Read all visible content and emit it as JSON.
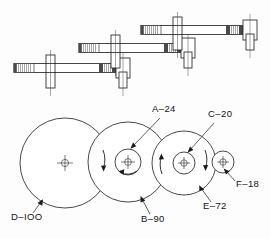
{
  "drawing": {
    "title": "Gear train assembly drawing",
    "background_color": "#fdfdfd",
    "line_color": "#1b1b1b"
  },
  "labels": {
    "a24": "A–24",
    "c20": "C–20",
    "f18": "F–18",
    "d100": "D–IOO",
    "b90": "B–90",
    "e72": "E–72"
  },
  "gears": [
    {
      "id": "D-100",
      "label": "D–IOO",
      "teeth": 100,
      "cx": 65,
      "cy": 163,
      "r": 45,
      "label_x": 14,
      "label_y": 217
    },
    {
      "id": "B-90",
      "label": "B–90",
      "teeth": 90,
      "cx": 128,
      "cy": 162,
      "r": 40,
      "label_x": 140,
      "label_y": 222
    },
    {
      "id": "A-24",
      "label": "A–24",
      "teeth": 24,
      "cx": 128,
      "cy": 162,
      "r": 13,
      "label_x": 154,
      "label_y": 112
    },
    {
      "id": "E-72",
      "label": "E–72",
      "teeth": 72,
      "cx": 184,
      "cy": 163,
      "r": 32,
      "label_x": 203,
      "label_y": 210
    },
    {
      "id": "C-20",
      "label": "C–20",
      "teeth": 20,
      "cx": 184,
      "cy": 163,
      "r": 11,
      "label_x": 208,
      "label_y": 117
    },
    {
      "id": "F-18",
      "label": "F–18",
      "teeth": 18,
      "cx": 223,
      "cy": 162,
      "r": 11,
      "label_x": 236,
      "label_y": 187
    }
  ],
  "rotation_arrows": [
    {
      "near": "D-100/B-90",
      "direction": "down"
    },
    {
      "near": "A-24",
      "direction": "left"
    },
    {
      "near": "B-90/E-72",
      "direction": "up"
    },
    {
      "near": "E-72/F-18",
      "direction": "down"
    }
  ],
  "shafts": [
    {
      "id": "shaft-lower",
      "note": "knurled end, pin collar, hatched hub"
    },
    {
      "id": "shaft-middle",
      "note": "knurled end, pin collar, hatched hub"
    },
    {
      "id": "shaft-upper",
      "note": "knurled end, pin collar, hatched hub"
    }
  ]
}
